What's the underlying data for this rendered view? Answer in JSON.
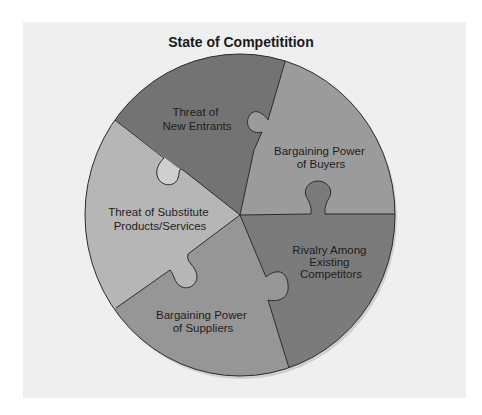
{
  "diagram": {
    "title": "State of Competitition",
    "pieces": [
      {
        "id": "new-entrants",
        "lines": [
          "Threat of",
          "New Entrants"
        ],
        "color": "#737373"
      },
      {
        "id": "buyers",
        "lines": [
          "Bargaining Power",
          "of Buyers"
        ],
        "color": "#9b9b9b"
      },
      {
        "id": "rivalry",
        "lines": [
          "Rivalry Among",
          "Existing",
          "Competitors"
        ],
        "color": "#7b7b7b"
      },
      {
        "id": "suppliers",
        "lines": [
          "Bargaining Power",
          "of Suppliers"
        ],
        "color": "#969696"
      },
      {
        "id": "substitutes",
        "lines": [
          "Threat of Substitute",
          "Products/Services"
        ],
        "color": "#b6b6b6"
      }
    ],
    "background_color": "#efefef",
    "outline_color": "#2a2a2a"
  }
}
